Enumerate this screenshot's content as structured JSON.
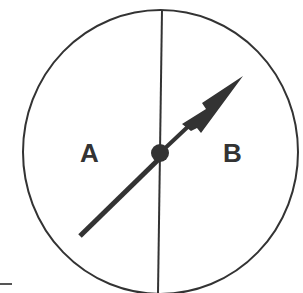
{
  "diagram": {
    "labels": {
      "left_region": "A",
      "right_region": "B"
    },
    "colors": {
      "stroke": "#333333",
      "background": "#ffffff"
    },
    "elements": [
      "circle",
      "vertical-divider",
      "spinner-arrow",
      "center-pivot",
      "tick-mark"
    ]
  }
}
